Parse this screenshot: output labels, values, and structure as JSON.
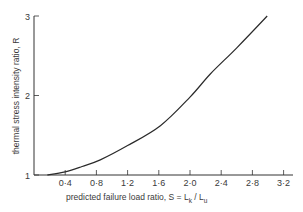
{
  "chart_data": {
    "type": "line",
    "title": "",
    "xlabel": "predicted failure load ratio, S = L_k / L_u",
    "ylabel": "thermal stress intensity ratio, R",
    "xlim": [
      0,
      3.2
    ],
    "ylim": [
      1,
      3
    ],
    "x_ticks": [
      "0·4",
      "0·8",
      "1·2",
      "1·6",
      "2·0",
      "2·4",
      "2·8",
      "3·2"
    ],
    "y_ticks": [
      "1",
      "2",
      "3"
    ],
    "grid": false,
    "legend": null,
    "series": [
      {
        "name": "R vs S",
        "x": [
          0.17,
          0.4,
          0.6,
          0.85,
          1.2,
          1.62,
          2.0,
          2.26,
          2.6,
          2.99
        ],
        "y": [
          1.0,
          1.04,
          1.1,
          1.19,
          1.37,
          1.62,
          1.98,
          2.27,
          2.6,
          3.0
        ]
      }
    ]
  },
  "labels": {
    "x_prefix": "predicted failure load ratio, S = L",
    "x_sub1": "k",
    "x_mid": " / L",
    "x_sub2": "u",
    "y": "thermal stress intensity ratio, R"
  }
}
